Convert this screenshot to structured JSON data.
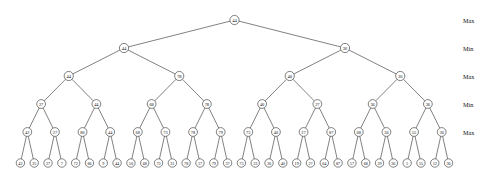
{
  "figure": {
    "type": "minimax-game-tree",
    "background_color": "#ffffff",
    "line_color": "#1a1a1a",
    "text_color": "#111111"
  },
  "row_labels": [
    {
      "label": "Max",
      "level": 0
    },
    {
      "label": "Min",
      "level": 1
    },
    {
      "label": "Max",
      "level": 2
    },
    {
      "label": "Min",
      "level": 3
    },
    {
      "label": "Max",
      "level": 4
    }
  ],
  "levels": [
    {
      "index": 0,
      "player": "Max",
      "y": 20,
      "values": [
        44
      ]
    },
    {
      "index": 1,
      "player": "Min",
      "y": 48,
      "values": [
        44,
        36
      ]
    },
    {
      "index": 2,
      "player": "Max",
      "y": 76,
      "values": [
        44,
        78,
        40,
        36
      ]
    },
    {
      "index": 3,
      "player": "Min",
      "y": 104,
      "values": [
        27,
        44,
        68,
        78,
        40,
        27,
        36,
        36
      ]
    },
    {
      "index": 4,
      "player": "Max",
      "y": 132,
      "values": [
        42,
        27,
        86,
        44,
        68,
        73,
        78,
        79,
        73,
        40,
        27,
        87,
        68,
        36,
        55,
        36
      ]
    },
    {
      "index": 5,
      "player": "Leaf",
      "y": 163,
      "values": [
        42,
        25,
        27,
        7,
        72,
        86,
        9,
        44,
        50,
        68,
        73,
        31,
        78,
        17,
        79,
        37,
        73,
        23,
        30,
        40,
        19,
        27,
        64,
        87,
        57,
        68,
        29,
        36,
        5,
        55,
        12,
        36
      ]
    }
  ],
  "chart_data": {
    "type": "tree",
    "title": "",
    "root_value": 44,
    "depth": 6,
    "branching_factor": 2,
    "leaf_count": 32,
    "alternating_players": [
      "Max",
      "Min",
      "Max",
      "Min",
      "Max"
    ],
    "levels": [
      {
        "player": "Max",
        "values": [
          44
        ]
      },
      {
        "player": "Min",
        "values": [
          44,
          36
        ]
      },
      {
        "player": "Max",
        "values": [
          44,
          78,
          40,
          36
        ]
      },
      {
        "player": "Min",
        "values": [
          27,
          44,
          68,
          78,
          40,
          27,
          36,
          36
        ]
      },
      {
        "player": "Max",
        "values": [
          42,
          27,
          86,
          44,
          68,
          73,
          78,
          79,
          73,
          40,
          27,
          87,
          68,
          36,
          55,
          36
        ]
      },
      {
        "player": "Leaf",
        "values": [
          42,
          25,
          27,
          7,
          72,
          86,
          9,
          44,
          50,
          68,
          73,
          31,
          78,
          17,
          79,
          37,
          73,
          23,
          30,
          40,
          19,
          27,
          64,
          87,
          57,
          68,
          29,
          36,
          5,
          55,
          12,
          36
        ]
      }
    ]
  }
}
